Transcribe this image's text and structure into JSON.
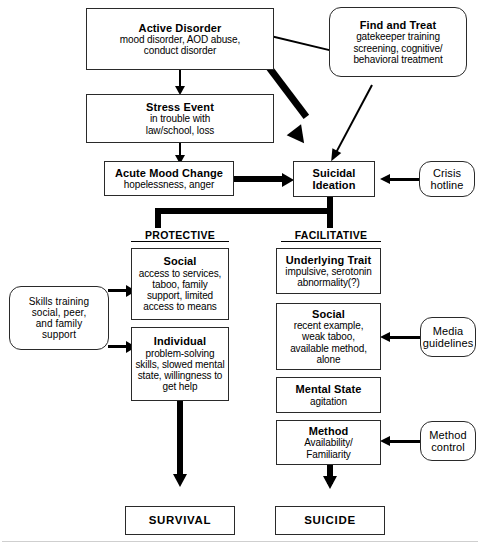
{
  "diagram": {
    "nodes": {
      "active_disorder": {
        "title": "Active Disorder",
        "sub": "mood disorder, AOD abuse,\nconduct disorder"
      },
      "find_and_treat": {
        "title": "Find and Treat",
        "sub": "gatekeeper training\nscreening, cognitive/\nbehavioral treatment"
      },
      "stress_event": {
        "title": "Stress Event",
        "sub": "in trouble with\nlaw/school, loss"
      },
      "acute_mood_change": {
        "title": "Acute Mood Change",
        "sub": "hopelessness, anger"
      },
      "suicidal_ideation": {
        "title": "Suicidal\nIdeation",
        "sub": ""
      },
      "crisis_hotline": {
        "title": "Crisis\nhotline",
        "sub": ""
      },
      "skills_training": {
        "title": "Skills training\nsocial, peer,\nand family\nsupport",
        "sub": ""
      },
      "protective_social": {
        "title": "Social",
        "sub": "access to services,\ntaboo, family\nsupport, limited\naccess to means"
      },
      "protective_individual": {
        "title": "Individual",
        "sub": "problem-solving\nskills, slowed mental\nstate, willingness to\nget help"
      },
      "underlying_trait": {
        "title": "Underlying Trait",
        "sub": "impulsive, serotonin\nabnormality(?)"
      },
      "facilitative_social": {
        "title": "Social",
        "sub": "recent example,\nweak taboo,\navailable method,\nalone"
      },
      "media_guidelines": {
        "title": "Media\nguidelines",
        "sub": ""
      },
      "mental_state": {
        "title": "Mental State",
        "sub": "agitation"
      },
      "method": {
        "title": "Method",
        "sub": "Availability/\nFamiliarity"
      },
      "method_control": {
        "title": "Method\ncontrol",
        "sub": ""
      },
      "survival": {
        "title": "SURVIVAL",
        "sub": ""
      },
      "suicide": {
        "title": "SUICIDE",
        "sub": ""
      }
    },
    "column_headers": {
      "protective": "PROTECTIVE",
      "facilitative": "FACILITATIVE"
    },
    "colors": {
      "line": "#000000",
      "box_border": "#2a2a2a",
      "background": "#ffffff",
      "text": "#000000"
    }
  }
}
